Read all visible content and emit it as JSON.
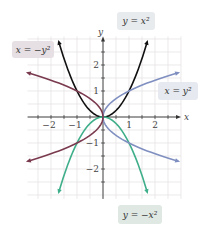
{
  "chart_data": {
    "type": "line",
    "title": "",
    "xlabel": "x",
    "ylabel": "y",
    "xlim": [
      -2.9,
      3.0
    ],
    "ylim": [
      -3.15,
      3.1
    ],
    "grid": true,
    "grid_minor_step": 0.5,
    "x_ticks": [
      "-2",
      "-1",
      "1",
      "2"
    ],
    "y_ticks": [
      "2",
      "1",
      "-1",
      "-2"
    ],
    "series": [
      {
        "name": "y = x²",
        "label": "y = x²",
        "color": "#111111",
        "relation": "y = x^2",
        "points": [
          [
            -1.7,
            2.89
          ],
          [
            -1,
            1
          ],
          [
            0,
            0
          ],
          [
            1,
            1
          ],
          [
            1.7,
            2.89
          ]
        ]
      },
      {
        "name": "y = −x²",
        "label": "y = −x²",
        "color": "#3fae8a",
        "relation": "y = -x^2",
        "points": [
          [
            -1.7,
            -2.89
          ],
          [
            -1,
            -1
          ],
          [
            0,
            0
          ],
          [
            1,
            -1
          ],
          [
            1.7,
            -2.89
          ]
        ]
      },
      {
        "name": "x = y²",
        "label": "x = y²",
        "color": "#7f8fc0",
        "relation": "x = y^2",
        "points": [
          [
            2.89,
            1.7
          ],
          [
            1,
            1
          ],
          [
            0,
            0
          ],
          [
            1,
            -1
          ],
          [
            2.89,
            -1.7
          ]
        ]
      },
      {
        "name": "x = −y²",
        "label": "x = −y²",
        "color": "#7a3a4e",
        "relation": "x = -y^2",
        "points": [
          [
            -2.89,
            1.7
          ],
          [
            -1,
            1
          ],
          [
            0,
            0
          ],
          [
            -1,
            -1
          ],
          [
            -2.89,
            -1.7
          ]
        ]
      }
    ],
    "labels": {
      "y_eq_x2": "y = x²",
      "y_eq_neg_x2": "y = −x²",
      "x_eq_y2": "x = y²",
      "x_eq_neg_y2": "x = −y²"
    },
    "label_colors": {
      "y_eq_x2": "#e8ebee",
      "y_eq_neg_x2": "#dfe8e3",
      "x_eq_y2": "#e6eaf0",
      "x_eq_neg_y2": "#e6dfe3"
    }
  }
}
